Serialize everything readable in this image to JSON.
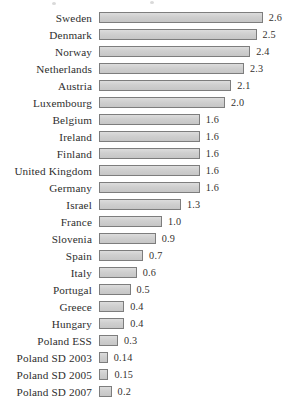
{
  "chart_data": {
    "type": "bar",
    "orientation": "horizontal",
    "title": "",
    "subtitle": "",
    "xlabel": "",
    "ylabel": "",
    "grid": false,
    "legend": null,
    "axis_visible": false,
    "xlim": [
      0,
      2.6
    ],
    "value_label_format": "decimal",
    "categories": [
      "Sweden",
      "Denmark",
      "Norway",
      "Netherlands",
      "Austria",
      "Luxembourg",
      "Belgium",
      "Ireland",
      "Finland",
      "United Kingdom",
      "Germany",
      "Israel",
      "France",
      "Slovenia",
      "Spain",
      "Italy",
      "Portugal",
      "Greece",
      "Hungary",
      "Poland ESS",
      "Poland SD 2003",
      "Poland SD 2005",
      "Poland SD 2007"
    ],
    "values": [
      2.6,
      2.5,
      2.4,
      2.3,
      2.1,
      2.0,
      1.6,
      1.6,
      1.6,
      1.6,
      1.6,
      1.3,
      1.0,
      0.9,
      0.7,
      0.6,
      0.5,
      0.4,
      0.4,
      0.3,
      0.14,
      0.15,
      0.2
    ],
    "value_labels": [
      "2.6",
      "2.5",
      "2.4",
      "2.3",
      "2.1",
      "2.0",
      "1.6",
      "1.6",
      "1.6",
      "1.6",
      "1.6",
      "1.3",
      "1.0",
      "0.9",
      "0.7",
      "0.6",
      "0.5",
      "0.4",
      "0.4",
      "0.3",
      "0.14",
      "0.15",
      "0.2"
    ],
    "bar_fill_color": "#cfcfcf",
    "bar_border_color": "#7d7d7d",
    "background_color": "#ffffff",
    "text_color": "#2e2e2e",
    "pixels_per_unit": 63
  }
}
